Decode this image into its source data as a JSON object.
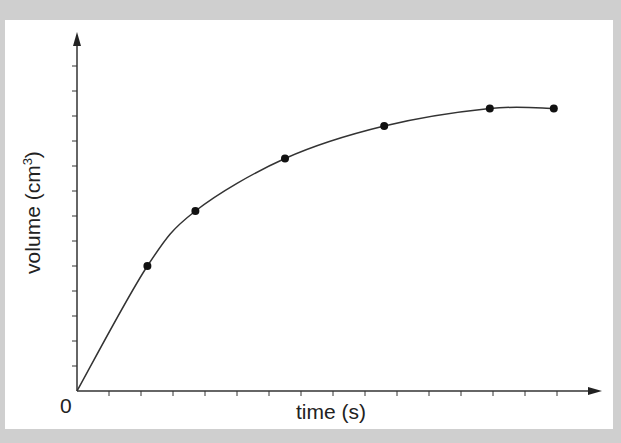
{
  "chart_data": {
    "type": "line",
    "title": "",
    "xlabel": "time (s)",
    "ylabel": "volume (cm³)",
    "origin_label": "0",
    "x_ticks": 15,
    "y_ticks": 13,
    "grid": false,
    "series": [
      {
        "name": "volume",
        "x": [
          2.2,
          3.7,
          6.5,
          9.6,
          12.9,
          14.9
        ],
        "y": [
          5.0,
          7.2,
          9.3,
          10.6,
          11.3,
          11.3
        ]
      }
    ],
    "units_note": "x in tick units (~32px each), y in tick units (~25px each); axes unlabelled numerically"
  },
  "labels": {
    "xlabel": "time (s)",
    "ylabel_main": "volume (cm",
    "ylabel_sup": "3",
    "ylabel_end": ")",
    "origin": "0"
  }
}
